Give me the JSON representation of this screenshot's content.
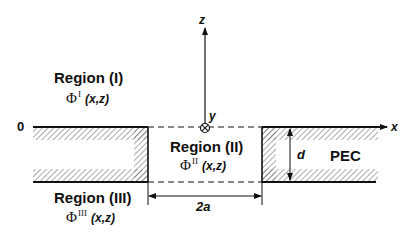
{
  "figure": {
    "type": "cross-section geometry diagram"
  },
  "axes": {
    "x_label": "x",
    "y_label": "y",
    "z_label": "z",
    "origin_label": "0",
    "y_direction": "into page (⊗)"
  },
  "regions": [
    {
      "title": "Region (I)",
      "phi_base": "Φ",
      "phi_superscript": "I",
      "phi_args": "(x,z)"
    },
    {
      "title": "Region (II)",
      "phi_base": "Φ",
      "phi_superscript": "II",
      "phi_args": "(x,z)"
    },
    {
      "title": "Region (III)",
      "phi_base": "Φ",
      "phi_superscript": "III",
      "phi_args": "(x,z)"
    }
  ],
  "material": {
    "label": "PEC"
  },
  "dimensions": {
    "thickness_label": "d",
    "width_label": "2a"
  },
  "colors": {
    "line": "#111111",
    "hatch": "#555555",
    "background": "#ffffff"
  }
}
